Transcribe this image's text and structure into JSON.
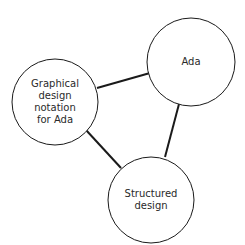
{
  "diagram": {
    "type": "network",
    "colors": {
      "stroke": "#1a1a1a",
      "background": "#ffffff",
      "text": "#2a2a2a"
    },
    "nodes": [
      {
        "id": "ada",
        "label": "Ada",
        "cx": 191,
        "cy": 62,
        "r": 44
      },
      {
        "id": "graphical",
        "label": "Graphical\ndesign\nnotation\nfor Ada",
        "cx": 55,
        "cy": 102,
        "r": 43
      },
      {
        "id": "structured",
        "label": "Structured\ndesign",
        "cx": 151,
        "cy": 200,
        "r": 43
      }
    ],
    "edges": [
      {
        "from": "graphical",
        "to": "ada",
        "x1": 97,
        "y1": 88,
        "x2": 150,
        "y2": 73
      },
      {
        "from": "ada",
        "to": "structured",
        "x1": 179,
        "y1": 104,
        "x2": 165,
        "y2": 157
      },
      {
        "from": "graphical",
        "to": "structured",
        "x1": 86,
        "y1": 130,
        "x2": 121,
        "y2": 168
      }
    ]
  }
}
